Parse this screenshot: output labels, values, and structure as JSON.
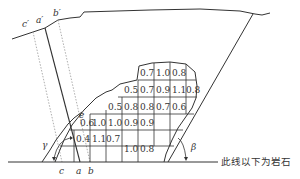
{
  "diagram": {
    "type": "geologic cross-section of landslide / slope with grid of coefficients",
    "colors": {
      "line": "#333333",
      "dotted": "#888888",
      "background": "#ffffff"
    },
    "surface_labels": {
      "c_prime": "c′",
      "a_prime": "a′",
      "b_prime": "b′"
    },
    "base_labels": {
      "c": "c",
      "a": "a",
      "b": "b"
    },
    "point_label_e": "e",
    "angles": {
      "left": "γ",
      "right": "β"
    },
    "base_note": "此线以下为岩石",
    "grid": {
      "rows": [
        {
          "cells": [
            "0.7",
            "1.0",
            "0.8"
          ]
        },
        {
          "cells": [
            "0.5",
            "0.7",
            "0.9",
            "1.1",
            "0.8"
          ]
        },
        {
          "cells": [
            "0.5",
            "0.8",
            "0.8",
            "0.7",
            "0.6"
          ]
        },
        {
          "cells": [
            "0.6",
            "1.0",
            "1.0",
            "0.9",
            "0.9"
          ]
        },
        {
          "cells": [
            "0.4",
            "1.1",
            "0.7",
            "1.0",
            "0.8"
          ]
        }
      ]
    }
  }
}
